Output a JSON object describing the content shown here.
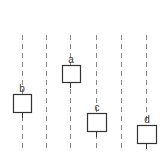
{
  "diagram": {
    "background": "#ffffff",
    "line_color": "#888888",
    "box_color": "#333333",
    "lines": [
      {
        "x": 22,
        "y1": 35,
        "y2": 148
      },
      {
        "x": 46,
        "y1": 35,
        "y2": 148
      },
      {
        "x": 70,
        "y1": 35,
        "y2": 148
      },
      {
        "x": 96,
        "y1": 35,
        "y2": 148
      },
      {
        "x": 121,
        "y1": 35,
        "y2": 148
      },
      {
        "x": 146,
        "y1": 35,
        "y2": 148
      }
    ],
    "boxes": [
      {
        "label": "a",
        "x": 62,
        "y": 65,
        "w": 18,
        "h": 17,
        "line_x": 70
      },
      {
        "label": "b",
        "x": 13,
        "y": 94,
        "w": 18,
        "h": 18,
        "line_x": 22
      },
      {
        "label": "c",
        "x": 87,
        "y": 113,
        "w": 19,
        "h": 18,
        "line_x": 96
      },
      {
        "label": "d",
        "x": 137,
        "y": 125,
        "w": 19,
        "h": 18,
        "line_x": 146
      }
    ]
  }
}
